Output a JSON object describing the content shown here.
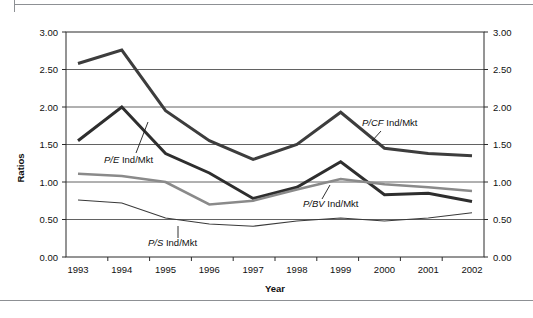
{
  "chart_data": {
    "type": "line",
    "title": "",
    "xlabel": "Year",
    "ylabel": "Ratios",
    "categories": [
      "1993",
      "1994",
      "1995",
      "1996",
      "1997",
      "1998",
      "1999",
      "2000",
      "2001",
      "2002"
    ],
    "x": [
      1993,
      1994,
      1995,
      1996,
      1997,
      1998,
      1999,
      2000,
      2001,
      2002
    ],
    "ylim": [
      0.0,
      3.0
    ],
    "ytick_labels": [
      "0.00",
      "0.50",
      "1.00",
      "1.50",
      "2.00",
      "2.50",
      "3.00"
    ],
    "ytick_values": [
      0.0,
      0.5,
      1.0,
      1.5,
      2.0,
      2.5,
      3.0
    ],
    "grid": true,
    "legend_position": "inline-annotations",
    "dual_y_axis": true,
    "series": [
      {
        "name": "P/CF Ind/Mkt",
        "label_prefix": "P/CF",
        "label_suffix": " Ind/Mkt",
        "color": "#3d3d3d",
        "width": 3.0,
        "values": [
          2.58,
          2.76,
          1.95,
          1.55,
          1.3,
          1.5,
          1.93,
          1.45,
          1.38,
          1.35
        ]
      },
      {
        "name": "P/E Ind/Mkt",
        "label_prefix": "P/E",
        "label_suffix": " Ind/Mkt",
        "color": "#2e2e2e",
        "width": 3.0,
        "values": [
          1.55,
          2.0,
          1.38,
          1.12,
          0.78,
          0.93,
          1.27,
          0.83,
          0.85,
          0.74
        ]
      },
      {
        "name": "P/BV Ind/Mkt",
        "label_prefix": "P/BV",
        "label_suffix": " Ind/Mkt",
        "color": "#8a8a8a",
        "width": 2.6,
        "values": [
          1.11,
          1.08,
          1.0,
          0.7,
          0.75,
          0.9,
          1.04,
          0.97,
          0.93,
          0.88
        ]
      },
      {
        "name": "P/S Ind/Mkt",
        "label_prefix": "P/S",
        "label_suffix": " Ind/Mkt",
        "color": "#3a3a3a",
        "width": 1.1,
        "values": [
          0.76,
          0.72,
          0.52,
          0.44,
          0.41,
          0.48,
          0.52,
          0.48,
          0.52,
          0.59
        ]
      }
    ],
    "annotations": [
      {
        "text": "P/CF Ind/Mkt",
        "series": "P/CF Ind/Mkt",
        "x": 362,
        "y": 126
      },
      {
        "text": "P/E Ind/Mkt",
        "series": "P/E Ind/Mkt",
        "x": 104,
        "y": 163
      },
      {
        "text": "P/BV Ind/Mkt",
        "series": "P/BV Ind/Mkt",
        "x": 303,
        "y": 207
      },
      {
        "text": "P/S Ind/Mkt",
        "series": "P/S Ind/Mkt",
        "x": 148,
        "y": 246
      }
    ]
  },
  "axes": {
    "left_ticks": [
      "3.00",
      "2.50",
      "2.00",
      "1.50",
      "1.00",
      "0.50",
      "0.00"
    ],
    "right_ticks": [
      "3.00",
      "2.50",
      "2.00",
      "1.50",
      "1.00",
      "0.50",
      "0.00"
    ],
    "y_title": "Ratios",
    "x_title": "Year",
    "x_ticks": [
      "1993",
      "1994",
      "1995",
      "1996",
      "1997",
      "1998",
      "1999",
      "2000",
      "2001",
      "2002"
    ]
  },
  "colors": {
    "grid": "#3a3a3a",
    "frame": "#2b2b2b",
    "text": "#101010",
    "rule": "#8d9094"
  }
}
